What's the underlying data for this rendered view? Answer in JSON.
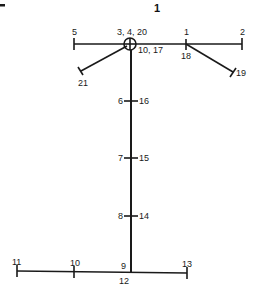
{
  "figure": {
    "title": "1",
    "corner_mark": "dash"
  },
  "labels": {
    "top_left_end": "5",
    "center_joint": "3, 4, 20",
    "center_joint_below": "10, 17",
    "top_right_joint": "1",
    "top_right_joint_below": "18",
    "top_right_end": "2",
    "left_diag_end": "21",
    "right_diag_end": "19",
    "spine_1_left": "6",
    "spine_1_right": "16",
    "spine_2_left": "7",
    "spine_2_right": "15",
    "spine_3_left": "8",
    "spine_3_right": "14",
    "bottom_left_end": "11",
    "bottom_left_mid": "10",
    "bottom_joint": "9",
    "bottom_joint_below": "12",
    "bottom_right_end": "13"
  },
  "colors": {
    "ink": "#1a1a1a",
    "background": "#ffffff"
  }
}
